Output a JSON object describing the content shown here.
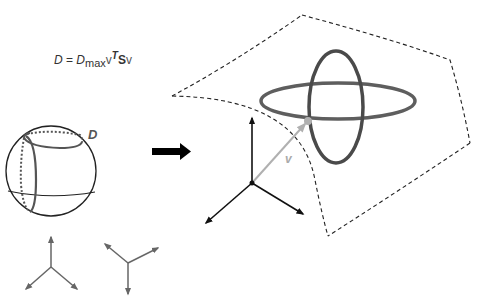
{
  "equation": {
    "lhs": "D",
    "equals": " = ",
    "dmax_base": "D",
    "dmax_sub": "max",
    "v1": "v",
    "transpose": "T",
    "matrix": "S",
    "v2": "v"
  },
  "labels": {
    "sphere_circle": "D",
    "vector": "v"
  },
  "colors": {
    "ellipse_dark": "#4a4a4a",
    "ellipse_mid": "#5e5e5e",
    "vector_gray": "#b0b0b0",
    "axes_dark": "#111111",
    "axes_small": "#666666",
    "dashed": "#222222"
  },
  "components": [
    "unit sphere with dotted/solid great circles labeled D",
    "large arrow indicating transformation",
    "3D axes with vector v to point on curved dashed surface",
    "two orthogonal ellipses on surface",
    "two small coordinate frames below sphere"
  ]
}
